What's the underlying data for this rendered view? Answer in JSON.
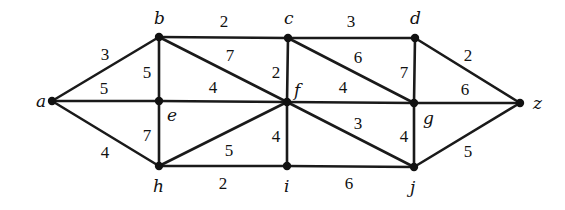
{
  "graph": {
    "type": "weighted-undirected-graph",
    "width": 565,
    "height": 210,
    "colors": {
      "edge": "#1a1a1a",
      "node": "#111111",
      "text": "#111111",
      "background": "#ffffff"
    },
    "vertices": [
      {
        "id": "a",
        "label": "a",
        "x": 52,
        "y": 101,
        "lx": 36,
        "ly": 107
      },
      {
        "id": "b",
        "label": "b",
        "x": 159,
        "y": 37,
        "lx": 154,
        "ly": 24
      },
      {
        "id": "c",
        "label": "c",
        "x": 288,
        "y": 38,
        "lx": 284,
        "ly": 24
      },
      {
        "id": "d",
        "label": "d",
        "x": 415,
        "y": 38,
        "lx": 410,
        "ly": 24
      },
      {
        "id": "e",
        "label": "e",
        "x": 159,
        "y": 101,
        "lx": 167,
        "ly": 121
      },
      {
        "id": "f",
        "label": "f",
        "x": 287,
        "y": 102,
        "lx": 294,
        "ly": 96
      },
      {
        "id": "g",
        "label": "g",
        "x": 414,
        "y": 103,
        "lx": 423,
        "ly": 124
      },
      {
        "id": "h",
        "label": "h",
        "x": 159,
        "y": 166,
        "lx": 153,
        "ly": 192
      },
      {
        "id": "i",
        "label": "i",
        "x": 287,
        "y": 166,
        "lx": 284,
        "ly": 192
      },
      {
        "id": "j",
        "label": "j",
        "x": 414,
        "y": 167,
        "lx": 410,
        "ly": 193
      },
      {
        "id": "z",
        "label": "z",
        "x": 520,
        "y": 103,
        "lx": 533,
        "ly": 109
      }
    ],
    "edges": [
      {
        "from": "a",
        "to": "b",
        "weight": "3",
        "wx": 105,
        "wy": 60
      },
      {
        "from": "a",
        "to": "e",
        "weight": "5",
        "wx": 104,
        "wy": 94
      },
      {
        "from": "a",
        "to": "h",
        "weight": "4",
        "wx": 105,
        "wy": 158
      },
      {
        "from": "b",
        "to": "c",
        "weight": "2",
        "wx": 224,
        "wy": 27
      },
      {
        "from": "b",
        "to": "e",
        "weight": "5",
        "wx": 147,
        "wy": 78
      },
      {
        "from": "b",
        "to": "f",
        "weight": "7",
        "wx": 230,
        "wy": 61
      },
      {
        "from": "c",
        "to": "d",
        "weight": "3",
        "wx": 351,
        "wy": 27
      },
      {
        "from": "c",
        "to": "f",
        "weight": "2",
        "wx": 276,
        "wy": 78
      },
      {
        "from": "c",
        "to": "g",
        "weight": "6",
        "wx": 358,
        "wy": 63
      },
      {
        "from": "d",
        "to": "g",
        "weight": "7",
        "wx": 404,
        "wy": 78
      },
      {
        "from": "d",
        "to": "z",
        "weight": "2",
        "wx": 468,
        "wy": 61
      },
      {
        "from": "e",
        "to": "f",
        "weight": "4",
        "wx": 213,
        "wy": 93
      },
      {
        "from": "e",
        "to": "h",
        "weight": "7",
        "wx": 147,
        "wy": 141
      },
      {
        "from": "f",
        "to": "g",
        "weight": "4",
        "wx": 343,
        "wy": 93
      },
      {
        "from": "f",
        "to": "h",
        "weight": "5",
        "wx": 229,
        "wy": 156
      },
      {
        "from": "f",
        "to": "i",
        "weight": "4",
        "wx": 276,
        "wy": 142
      },
      {
        "from": "f",
        "to": "j",
        "weight": "3",
        "wx": 358,
        "wy": 129
      },
      {
        "from": "g",
        "to": "j",
        "weight": "4",
        "wx": 404,
        "wy": 142
      },
      {
        "from": "g",
        "to": "z",
        "weight": "6",
        "wx": 465,
        "wy": 95
      },
      {
        "from": "h",
        "to": "i",
        "weight": "2",
        "wx": 223,
        "wy": 189
      },
      {
        "from": "i",
        "to": "j",
        "weight": "6",
        "wx": 349,
        "wy": 189
      },
      {
        "from": "j",
        "to": "z",
        "weight": "5",
        "wx": 468,
        "wy": 157
      }
    ]
  }
}
